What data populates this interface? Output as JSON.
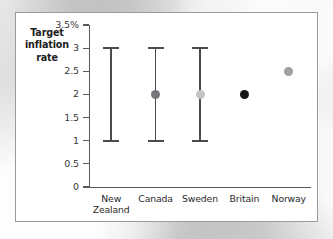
{
  "chart_data": {
    "type": "scatter",
    "title": "",
    "xlabel": "",
    "ylabel": "Target inflation rate",
    "ylim": [
      0,
      3.5
    ],
    "yunit": "%",
    "grid": false,
    "legend": "none",
    "y_ticks": [
      {
        "value": 3.5,
        "label": "3.5%"
      },
      {
        "value": 3,
        "label": "3"
      },
      {
        "value": 2.5,
        "label": "2.5"
      },
      {
        "value": 2,
        "label": "2"
      },
      {
        "value": 1.5,
        "label": "1.5"
      },
      {
        "value": 1,
        "label": "1"
      },
      {
        "value": 0.5,
        "label": "0.5"
      },
      {
        "value": 0,
        "label": "0"
      }
    ],
    "categories": [
      "New Zealand",
      "Canada",
      "Sweden",
      "Britain",
      "Norway"
    ],
    "points": [
      {
        "category": "New Zealand",
        "label_line1": "New",
        "label_line2": "Zealand",
        "range_low": 1,
        "range_high": 3,
        "has_range": true,
        "center": null,
        "has_center": false,
        "dot_color": ""
      },
      {
        "category": "Canada",
        "label_line1": "Canada",
        "label_line2": "",
        "range_low": 1,
        "range_high": 3,
        "has_range": true,
        "center": 2,
        "has_center": true,
        "dot_color": "#76767a"
      },
      {
        "category": "Sweden",
        "label_line1": "Sweden",
        "label_line2": "",
        "range_low": 1,
        "range_high": 3,
        "has_range": true,
        "center": 2,
        "has_center": true,
        "dot_color": "#c3c3c5"
      },
      {
        "category": "Britain",
        "label_line1": "Britain",
        "label_line2": "",
        "range_low": null,
        "range_high": null,
        "has_range": false,
        "center": 2,
        "has_center": true,
        "dot_color": "#161616"
      },
      {
        "category": "Norway",
        "label_line1": "Norway",
        "label_line2": "",
        "range_low": null,
        "range_high": null,
        "has_range": false,
        "center": 2.5,
        "has_center": true,
        "dot_color": "#a0a0a2"
      }
    ],
    "colors": {
      "axis": "#58585a",
      "range_bar": "#4b4b4d",
      "card_background": "#ffffff",
      "card_border": "#9a9a9a"
    }
  }
}
